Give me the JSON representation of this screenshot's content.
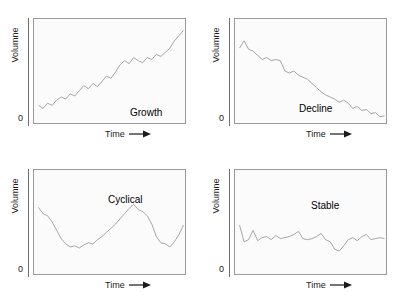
{
  "figure": {
    "axis_label_y": "Volumne",
    "axis_label_x": "Time",
    "axis_origin": "0",
    "line_color": "#9c9c9c",
    "frame_color": "#9a9a9a",
    "plot_background": "#fbfbfb",
    "text_color": "#1a1a1a"
  },
  "chart_data": [
    {
      "type": "line",
      "title": "Growth",
      "xlabel": "Time",
      "ylabel": "Volumne",
      "xlim": [
        0,
        100
      ],
      "ylim": [
        0,
        100
      ],
      "grid": false,
      "legend": "none",
      "annotations": [
        "Growth"
      ],
      "ticks": {
        "y": [
          "0"
        ],
        "x": []
      },
      "x": [
        3,
        6,
        9,
        12,
        15,
        18,
        21,
        24,
        27,
        30,
        33,
        36,
        39,
        42,
        45,
        48,
        51,
        54,
        57,
        60,
        63,
        66,
        69,
        72,
        75,
        78,
        81,
        84,
        87,
        90,
        93,
        96,
        99
      ],
      "values": [
        17,
        14,
        19,
        17,
        22,
        25,
        23,
        28,
        26,
        31,
        36,
        33,
        38,
        35,
        40,
        45,
        43,
        49,
        56,
        60,
        57,
        63,
        60,
        58,
        63,
        61,
        66,
        64,
        68,
        72,
        79,
        84,
        89
      ]
    },
    {
      "type": "line",
      "title": "Decline",
      "xlabel": "Time",
      "ylabel": "Volumne",
      "xlim": [
        0,
        100
      ],
      "ylim": [
        0,
        100
      ],
      "grid": false,
      "legend": "none",
      "annotations": [
        "Decline"
      ],
      "ticks": {
        "y": [
          "0"
        ],
        "x": []
      },
      "x": [
        3,
        6,
        9,
        12,
        15,
        18,
        21,
        24,
        27,
        30,
        33,
        36,
        39,
        42,
        45,
        48,
        51,
        54,
        57,
        60,
        63,
        66,
        69,
        72,
        75,
        78,
        81,
        84,
        87,
        90,
        93,
        96,
        99
      ],
      "values": [
        72,
        79,
        71,
        69,
        65,
        61,
        63,
        60,
        61,
        60,
        50,
        48,
        50,
        46,
        44,
        42,
        38,
        34,
        30,
        27,
        25,
        23,
        20,
        22,
        19,
        14,
        16,
        12,
        13,
        9,
        10,
        6,
        7
      ]
    },
    {
      "type": "line",
      "title": "Cyclical",
      "xlabel": "Time",
      "ylabel": "Volumne",
      "xlim": [
        0,
        100
      ],
      "ylim": [
        0,
        100
      ],
      "grid": false,
      "legend": "none",
      "annotations": [
        "Cyclical"
      ],
      "ticks": {
        "y": [
          "0"
        ],
        "x": []
      },
      "x": [
        3,
        6,
        9,
        12,
        15,
        18,
        21,
        24,
        27,
        30,
        33,
        36,
        39,
        42,
        45,
        48,
        51,
        54,
        57,
        60,
        63,
        66,
        69,
        72,
        75,
        78,
        81,
        84,
        87,
        90,
        93,
        96,
        99
      ],
      "values": [
        64,
        58,
        56,
        50,
        42,
        34,
        29,
        26,
        27,
        25,
        28,
        30,
        29,
        33,
        36,
        40,
        44,
        48,
        53,
        58,
        63,
        67,
        62,
        60,
        56,
        48,
        36,
        30,
        29,
        26,
        31,
        38,
        47
      ]
    },
    {
      "type": "line",
      "title": "Stable",
      "xlabel": "Time",
      "ylabel": "Volumne",
      "xlim": [
        0,
        100
      ],
      "ylim": [
        0,
        100
      ],
      "grid": false,
      "legend": "none",
      "annotations": [
        "Stable"
      ],
      "ticks": {
        "y": [
          "0"
        ],
        "x": []
      },
      "x": [
        3,
        6,
        9,
        12,
        15,
        18,
        21,
        24,
        27,
        30,
        33,
        36,
        39,
        42,
        45,
        48,
        51,
        54,
        57,
        60,
        63,
        66,
        69,
        72,
        75,
        78,
        81,
        84,
        87,
        90,
        93,
        96,
        99
      ],
      "values": [
        47,
        31,
        33,
        42,
        32,
        35,
        36,
        33,
        37,
        34,
        35,
        36,
        38,
        41,
        34,
        33,
        34,
        36,
        39,
        33,
        31,
        24,
        22,
        27,
        33,
        35,
        32,
        36,
        38,
        33,
        34,
        35,
        34
      ]
    }
  ],
  "panels": [
    {
      "id": "growth",
      "label": "Growth"
    },
    {
      "id": "decline",
      "label": "Decline"
    },
    {
      "id": "cyclical",
      "label": "Cyclical"
    },
    {
      "id": "stable",
      "label": "Stable"
    }
  ]
}
